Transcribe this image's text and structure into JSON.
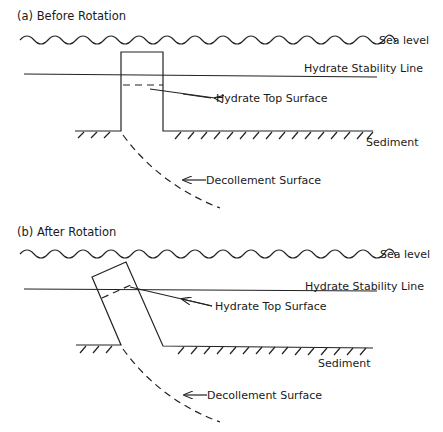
{
  "figure": {
    "panels": [
      {
        "id": "a",
        "title": "(a)  Before Rotation",
        "labels": {
          "sea_level": "Sea  level",
          "hydrate_stability_line": "Hydrate  Stability  Line",
          "hydrate_top_surface": "Hydrate Top Surface",
          "sediment": "Sediment",
          "decollement_surface": "Decollement   Surface"
        }
      },
      {
        "id": "b",
        "title": "(b)  After Rotation",
        "labels": {
          "sea_level": "Sea  level",
          "hydrate_stability_line": "Hydrate  Stability  Line",
          "hydrate_top_surface": "Hydrate Top Surface",
          "sediment": "Sediment",
          "decollement_surface": "Decollement   Surface"
        }
      }
    ]
  },
  "colors": {
    "line": "#222222",
    "background": "#ffffff"
  }
}
